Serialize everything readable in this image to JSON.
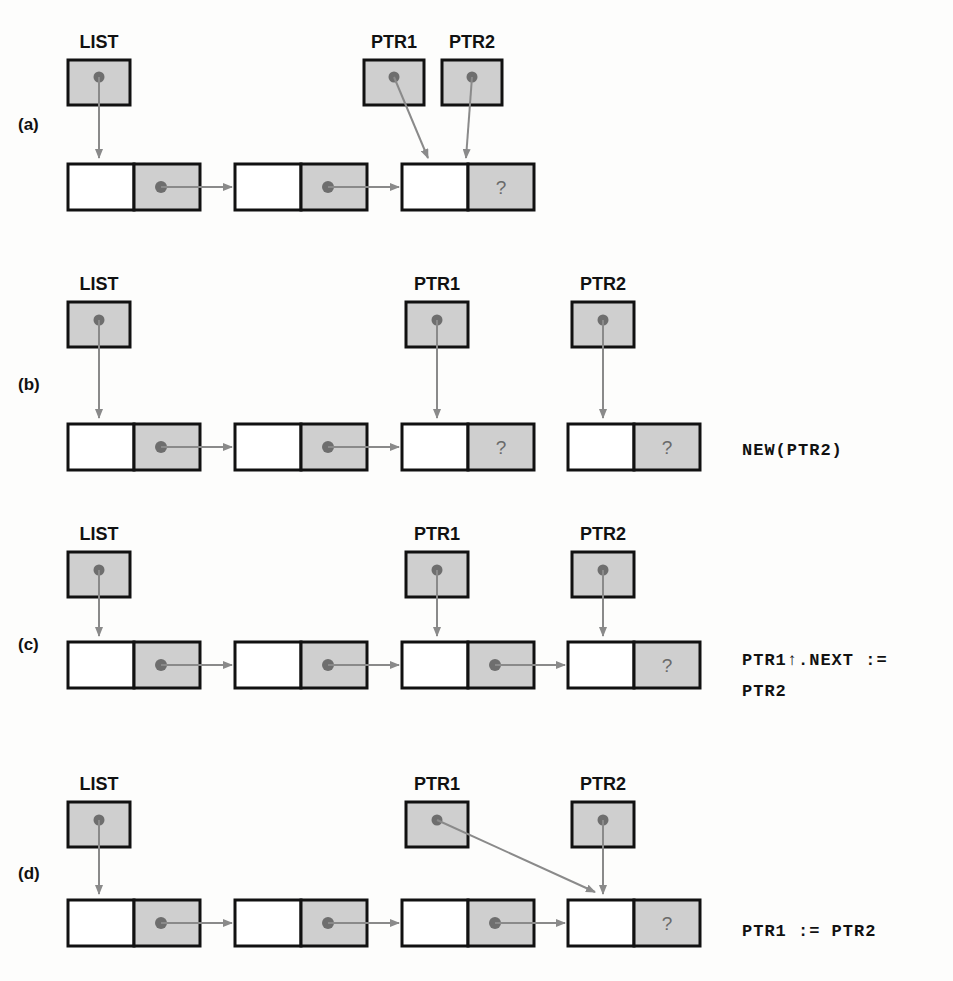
{
  "figure": {
    "panels": [
      {
        "id": "a",
        "label": "(a)",
        "code": "",
        "pointer_labels": [
          "LIST",
          "PTR1",
          "PTR2"
        ],
        "nodes": 3,
        "unknown_marker": "?"
      },
      {
        "id": "b",
        "label": "(b)",
        "code": "NEW(PTR2)",
        "pointer_labels": [
          "LIST",
          "PTR1",
          "PTR2"
        ],
        "nodes": 4,
        "unknown_marker": "?"
      },
      {
        "id": "c",
        "label": "(c)",
        "code": "PTR1↑.NEXT :=",
        "code_line2": "PTR2",
        "pointer_labels": [
          "LIST",
          "PTR1",
          "PTR2"
        ],
        "nodes": 4,
        "unknown_marker": "?"
      },
      {
        "id": "d",
        "label": "(d)",
        "code": "PTR1 := PTR2",
        "pointer_labels": [
          "LIST",
          "PTR1",
          "PTR2"
        ],
        "nodes": 4,
        "unknown_marker": "?"
      }
    ],
    "labels": {
      "list": "LIST",
      "ptr1": "PTR1",
      "ptr2": "PTR2",
      "unknown": "?"
    },
    "colors": {
      "box_fill_gray": "#cfcfcf",
      "box_fill_white": "#ffffff",
      "box_stroke": "#111111",
      "arrow": "#8a8a8a",
      "dot": "#6e6e6e",
      "text": "#111111",
      "background": "#fdfdfc"
    }
  }
}
